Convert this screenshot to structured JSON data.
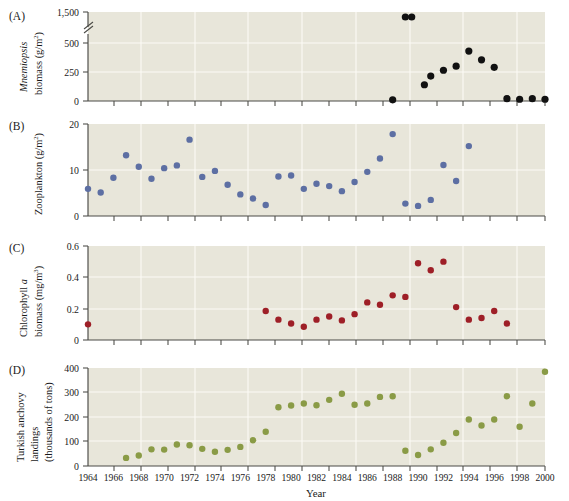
{
  "figure": {
    "xaxis_title": "Year",
    "x_ticks": [
      1964,
      1966,
      1968,
      1970,
      1972,
      1974,
      1976,
      1978,
      1980,
      1982,
      1984,
      1986,
      1988,
      1990,
      1992,
      1994,
      1996,
      1998,
      2000
    ],
    "x_range": [
      1964,
      2000
    ],
    "panels": [
      {
        "letter": "(A)",
        "title_line1": "Mnemiopsis",
        "title_line1_italic": true,
        "title_line2": "biomass (g/m2)",
        "y_ticks": [
          "0",
          "250",
          "500",
          "1,500"
        ],
        "y_unit": "g/m^2",
        "axis_break": true,
        "point_color": "#111111"
      },
      {
        "letter": "(B)",
        "title_line1": "Zooplankton (g/m2)",
        "y_ticks": [
          "0",
          "10",
          "20"
        ],
        "y_unit": "g/m^2",
        "axis_break": false,
        "point_color": "#5d6fa3"
      },
      {
        "letter": "(C)",
        "title_line1": "Chlorophyll a",
        "title_line2": "biomass (mg/m3)",
        "y_ticks": [
          "0",
          "0.2",
          "0.4",
          "0.6"
        ],
        "y_unit": "mg/m^3",
        "axis_break": false,
        "point_color": "#9e1f27"
      },
      {
        "letter": "(D)",
        "title_line1": "Turkish anchovy",
        "title_line2": "landings",
        "title_line3": "(thousands of tons)",
        "y_ticks": [
          "0",
          "100",
          "200",
          "300",
          "400"
        ],
        "y_unit": "thousands of tons",
        "axis_break": false,
        "point_color": "#8a9b46"
      }
    ]
  },
  "chart_data": [
    {
      "type": "scatter",
      "panel": "A",
      "title": "Mnemiopsis biomass (g/m2)",
      "xlabel": "Year",
      "ylabel": "Mnemiopsis biomass (g/m²)",
      "xlim": [
        1964,
        2000
      ],
      "ylim": [
        0,
        1500
      ],
      "axis_break_between": [
        500,
        1500
      ],
      "ytick_values": [
        0,
        250,
        500,
        1500
      ],
      "grid": true,
      "color": "#111111",
      "x": [
        1988,
        1989,
        1989.5,
        1990.5,
        1991,
        1992,
        1993,
        1994,
        1995,
        1996,
        1997,
        1998,
        1999,
        2000
      ],
      "y": [
        10,
        1500,
        1500,
        140,
        215,
        265,
        300,
        430,
        355,
        290,
        20,
        15,
        20,
        15
      ],
      "points": [
        {
          "year": 1988,
          "value": 10
        },
        {
          "year": 1989,
          "value": 1500
        },
        {
          "year": 1990,
          "value": 1500
        },
        {
          "year": 1991,
          "value": 140
        },
        {
          "year": 1992,
          "value": 215
        },
        {
          "year": 1993,
          "value": 260
        },
        {
          "year": 1994,
          "value": 300
        },
        {
          "year": 1995,
          "value": 430
        },
        {
          "year": 1996,
          "value": 355
        },
        {
          "year": 1997,
          "value": 290
        },
        {
          "year": 1998,
          "value": 15
        },
        {
          "year": 1999,
          "value": 15
        }
      ]
    },
    {
      "type": "scatter",
      "panel": "B",
      "title": "Zooplankton (g/m2)",
      "xlabel": "Year",
      "ylabel": "Zooplankton (g/m²)",
      "xlim": [
        1964,
        2000
      ],
      "ylim": [
        0,
        20
      ],
      "ytick_values": [
        0,
        10,
        20
      ],
      "grid": true,
      "color": "#5d6fa3",
      "x": [
        1964,
        1965,
        1966,
        1967,
        1968,
        1969,
        1970,
        1971,
        1972,
        1973,
        1974,
        1975,
        1976,
        1977,
        1978,
        1979,
        1980,
        1981,
        1982,
        1983,
        1984,
        1985,
        1986,
        1987,
        1988,
        1989,
        1990,
        1991,
        1992,
        1993,
        1994
      ],
      "y": [
        5.9,
        5.1,
        8.3,
        13.2,
        10.7,
        8.1,
        10.4,
        11.0,
        16.6,
        8.5,
        9.8,
        6.8,
        4.7,
        3.8,
        2.4,
        8.6,
        8.8,
        5.9,
        7.0,
        6.5,
        5.4,
        7.4,
        9.6,
        12.5,
        17.8,
        2.7,
        2.2,
        3.5,
        11.1,
        7.6,
        15.2
      ]
    },
    {
      "type": "scatter",
      "panel": "C",
      "title": "Chlorophyll a biomass (mg/m3)",
      "xlabel": "Year",
      "ylabel": "Chlorophyll a biomass (mg/m³)",
      "xlim": [
        1964,
        2000
      ],
      "ylim": [
        0,
        0.6
      ],
      "ytick_values": [
        0,
        0.2,
        0.4,
        0.6
      ],
      "grid": true,
      "color": "#9e1f27",
      "x": [
        1964,
        1978,
        1979,
        1980,
        1981,
        1982,
        1983,
        1984,
        1985,
        1986,
        1987,
        1988,
        1989,
        1990,
        1991,
        1992,
        1993,
        1994,
        1995,
        1996,
        1997
      ],
      "y": [
        0.1,
        0.185,
        0.13,
        0.105,
        0.085,
        0.13,
        0.15,
        0.125,
        0.165,
        0.24,
        0.225,
        0.285,
        0.275,
        0.49,
        0.445,
        0.5,
        0.21,
        0.13,
        0.14,
        0.185,
        0.105
      ]
    },
    {
      "type": "scatter",
      "panel": "D",
      "title": "Turkish anchovy landings (thousands of tons)",
      "xlabel": "Year",
      "ylabel": "Turkish anchovy landings (thousands of tons)",
      "xlim": [
        1964,
        2000
      ],
      "ylim": [
        0,
        400
      ],
      "ytick_values": [
        0,
        100,
        200,
        300,
        400
      ],
      "grid": true,
      "color": "#8a9b46",
      "x": [
        1967,
        1968,
        1969,
        1970,
        1971,
        1972,
        1973,
        1974,
        1975,
        1976,
        1977,
        1978,
        1979,
        1980,
        1981,
        1982,
        1983,
        1984,
        1985,
        1986,
        1987,
        1988,
        1989,
        1990,
        1991,
        1992,
        1993,
        1994,
        1995,
        1996,
        1997,
        1998,
        1999,
        2000
      ],
      "y": [
        33,
        43,
        68,
        67,
        88,
        85,
        70,
        58,
        66,
        78,
        105,
        140,
        240,
        247,
        255,
        248,
        270,
        295,
        250,
        255,
        282,
        285,
        62,
        45,
        68,
        95,
        135,
        190,
        165,
        190,
        285,
        160,
        255,
        385
      ]
    }
  ]
}
